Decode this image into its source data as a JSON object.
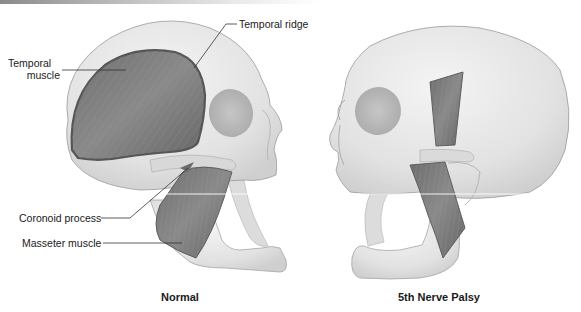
{
  "figure": {
    "panels": [
      {
        "id": "normal",
        "caption": "Normal",
        "labels": [
          {
            "id": "temporal-ridge",
            "text": "Temporal ridge"
          },
          {
            "id": "temporal-muscle",
            "text": "Temporal\nmuscle",
            "line1": "Temporal",
            "line2": "muscle"
          },
          {
            "id": "coronoid-process",
            "text": "Coronoid process"
          },
          {
            "id": "masseter-muscle",
            "text": "Masseter muscle"
          }
        ]
      },
      {
        "id": "palsy",
        "caption": "5th Nerve Palsy",
        "labels": []
      }
    ],
    "colors": {
      "bone": "#e6e6e6",
      "bone_shadow": "#c8c8c8",
      "bone_outline": "#9a9a9a",
      "muscle": "#7a7a7a",
      "muscle_dark": "#5c5c5c",
      "leader_line": "#333333",
      "text": "#1a1a1a"
    }
  }
}
